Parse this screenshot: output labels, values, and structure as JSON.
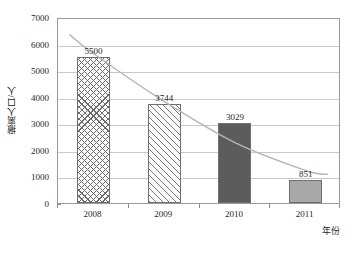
{
  "chart_data": {
    "type": "bar",
    "title": "",
    "subtitle": "",
    "xlabel": "年份",
    "ylabel": "撤离人口/人",
    "categories": [
      "2008",
      "2009",
      "2010",
      "2011"
    ],
    "values": [
      5500,
      3744,
      3029,
      851
    ],
    "data_labels": [
      "5500",
      "3744",
      "3029",
      "851"
    ],
    "ylim": [
      0,
      7000
    ],
    "ytick_labels": [
      "0",
      "1000",
      "2000",
      "3000",
      "4000",
      "5000",
      "6000",
      "7000"
    ],
    "ytick_values": [
      0,
      1000,
      2000,
      3000,
      4000,
      5000,
      6000,
      7000
    ],
    "grid": "horizontal",
    "legend": "none",
    "series": [
      {
        "name": "撤离人口",
        "values": [
          5500,
          3744,
          3029,
          851
        ],
        "bar_styles": [
          "crosshatch",
          "diagonal",
          "solid-dark",
          "solid-light"
        ]
      },
      {
        "name": "趋势线",
        "type": "trend-curve",
        "style": "smooth light gray curve",
        "color": "#b4b4b4"
      }
    ],
    "colors": {
      "bar_crosshatch": "#6b6b6b",
      "bar_diagonal": "#7a7a7a",
      "bar_solid_dark": "#5c5c5c",
      "bar_solid_light": "#a8a8a8",
      "gridline": "#c9c9c9",
      "axis": "#9a9a9a",
      "trend": "#b4b4b4",
      "text": "#1f1f1f"
    }
  }
}
